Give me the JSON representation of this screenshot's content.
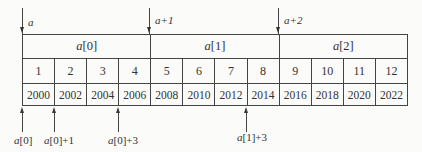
{
  "top_pointers": [
    {
      "label": "a",
      "x": 22
    },
    {
      "label": "a+1",
      "x": 150
    },
    {
      "label": "a+2",
      "x": 279
    }
  ],
  "groups": [
    {
      "name": "a",
      "index": "[0]"
    },
    {
      "name": "a",
      "index": "[1]"
    },
    {
      "name": "a",
      "index": "[2]"
    }
  ],
  "values": [
    "1",
    "2",
    "3",
    "4",
    "5",
    "6",
    "7",
    "8",
    "9",
    "10",
    "11",
    "12"
  ],
  "addresses": [
    "2000",
    "2002",
    "2004",
    "2006",
    "2008",
    "2010",
    "2012",
    "2014",
    "2016",
    "2018",
    "2020",
    "2022"
  ],
  "bottom_pointers": [
    {
      "name": "a",
      "suffix": "[0]"
    },
    {
      "name": "a",
      "suffix": "[0]+1"
    },
    {
      "name": "a",
      "suffix": "[0]+3"
    },
    {
      "name": "a",
      "suffix": "[1]+3"
    }
  ]
}
